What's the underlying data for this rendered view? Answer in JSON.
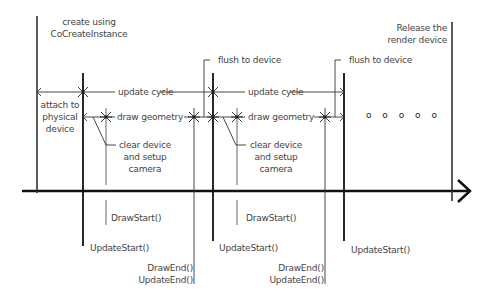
{
  "diagram": {
    "colors": {
      "line": "#111111",
      "thin": "#333333",
      "text": "#444444",
      "background": "#ffffff"
    },
    "labels": {
      "create": [
        "create using",
        "CoCreateInstance"
      ],
      "release": [
        "Release the",
        "render device"
      ],
      "attach": [
        "attach to",
        "physical",
        "device"
      ],
      "update_cycle_1": "update cycle",
      "update_cycle_2": "update cycle",
      "draw_geometry_1": "draw geometry",
      "draw_geometry_2": "draw geometry",
      "clear_1": [
        "clear device",
        "and setup",
        "camera"
      ],
      "clear_2": [
        "clear device",
        "and setup",
        "camera"
      ],
      "flush_1": "flush to device",
      "flush_2": "flush to device",
      "continuation": "o o o o o",
      "draw_start_1": "DrawStart()",
      "draw_start_2": "DrawStart()",
      "update_start_1": "UpdateStart()",
      "update_start_2": "UpdateStart()",
      "update_start_3": "UpdateStart()",
      "draw_end_1": "DrawEnd()",
      "update_end_1": "UpdateEnd()",
      "draw_end_2": "DrawEnd()",
      "update_end_2": "UpdateEnd()"
    }
  }
}
